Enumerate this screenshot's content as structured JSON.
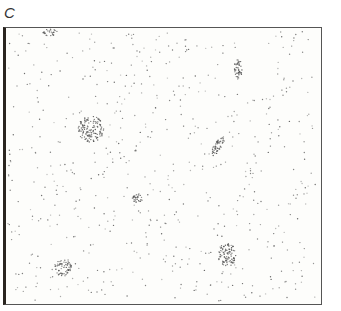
{
  "figure": {
    "panel_label": "C",
    "frame": {
      "x": 3,
      "y": 27,
      "width": 319,
      "height": 278
    },
    "background_dot_count": 620,
    "dot_color": "#555555",
    "clusters": [
      {
        "name": "top-left-edge",
        "cx": 50,
        "cy": 32,
        "rx": 7,
        "ry": 4,
        "n": 25
      },
      {
        "name": "upper-right",
        "cx": 238,
        "cy": 69,
        "rx": 4,
        "ry": 10,
        "n": 45
      },
      {
        "name": "left-large",
        "cx": 91,
        "cy": 129,
        "rx": 13,
        "ry": 13,
        "n": 130
      },
      {
        "name": "center-right-elongated",
        "cx": 218,
        "cy": 146,
        "rx": 4,
        "ry": 11,
        "n": 50,
        "angle": 30
      },
      {
        "name": "center-small",
        "cx": 137,
        "cy": 198,
        "rx": 5,
        "ry": 5,
        "n": 30
      },
      {
        "name": "bottom-right",
        "cx": 227,
        "cy": 255,
        "rx": 9,
        "ry": 12,
        "n": 90
      },
      {
        "name": "bottom-left",
        "cx": 63,
        "cy": 268,
        "rx": 9,
        "ry": 8,
        "n": 60
      }
    ]
  }
}
